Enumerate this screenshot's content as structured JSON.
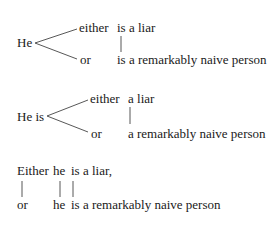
{
  "diagrams": [
    {
      "subject": "He",
      "branch_top": "either",
      "branch_bottom": "or",
      "predicate_top": "is a liar",
      "predicate_bottom": "is a remarkably naive person"
    },
    {
      "subject": "He is",
      "branch_top": "either",
      "branch_bottom": "or",
      "predicate_top": "a liar",
      "predicate_bottom": "a remarkably naive person"
    },
    {
      "top": {
        "conj": "Either",
        "subject": "he",
        "predicate": "is a liar,"
      },
      "bottom": {
        "conj": "or",
        "subject": "he",
        "predicate": "is a remarkably naive person"
      }
    }
  ],
  "colors": {
    "text": "#1a1a1a",
    "lines": "#444444",
    "background": "#ffffff"
  }
}
